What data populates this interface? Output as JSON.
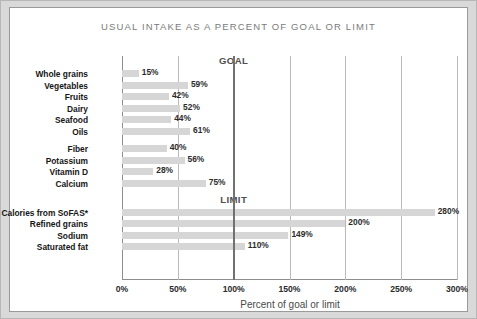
{
  "card": {
    "title": "USUAL INTAKE AS A PERCENT OF GOAL OR LIMIT"
  },
  "colors": {
    "bar": "#d6d6d6",
    "gridline": "#b9b9b9",
    "marker_line": "#717171",
    "axis": "#8d8d8d",
    "title_text": "#7b7b7b",
    "label_text": "#161616",
    "page_background": "#d9d9d9",
    "card_background": "#ffffff"
  },
  "chart_data": {
    "type": "bar",
    "orientation": "horizontal",
    "title": "USUAL INTAKE AS A PERCENT OF GOAL OR LIMIT",
    "xlabel": "Percent of goal or limit",
    "ylabel": "",
    "xlim": [
      0,
      300
    ],
    "xticks": [
      0,
      50,
      100,
      150,
      200,
      250,
      300
    ],
    "xticklabels": [
      "0%",
      "50%",
      "100%",
      "150%",
      "200%",
      "250%",
      "300%"
    ],
    "grid": true,
    "legend": false,
    "reference_lines": [
      {
        "value": 100,
        "label": "GOAL",
        "group": "eat-more"
      },
      {
        "value": 100,
        "label": "LIMIT",
        "group": "eat-less"
      }
    ],
    "groups": [
      {
        "id": "eat-more",
        "heading": "Eat more of these:",
        "marker_label": "GOAL",
        "subgroups": [
          {
            "categories": [
              "Whole grains",
              "Vegetables",
              "Fruits",
              "Dairy",
              "Seafood",
              "Oils"
            ],
            "values": [
              15,
              59,
              42,
              52,
              44,
              61
            ],
            "value_labels": [
              "15%",
              "59%",
              "42%",
              "52%",
              "44%",
              "61%"
            ]
          },
          {
            "categories": [
              "Fiber",
              "Potassium",
              "Vitamin D",
              "Calcium"
            ],
            "values": [
              40,
              56,
              28,
              75
            ],
            "value_labels": [
              "40%",
              "56%",
              "28%",
              "75%"
            ]
          }
        ]
      },
      {
        "id": "eat-less",
        "heading": "Eat less of these:",
        "marker_label": "LIMIT",
        "subgroups": [
          {
            "categories": [
              "Calories from SoFAS*",
              "Refined grains",
              "Sodium",
              "Saturated fat"
            ],
            "values": [
              280,
              200,
              149,
              110
            ],
            "value_labels": [
              "280%",
              "200%",
              "149%",
              "110%"
            ]
          }
        ]
      }
    ]
  }
}
